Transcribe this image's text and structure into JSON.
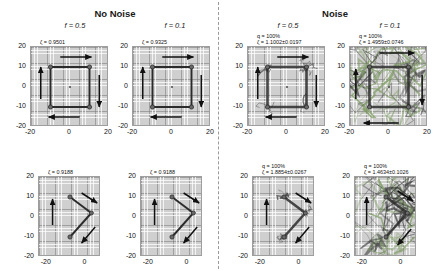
{
  "figure": {
    "groups": [
      {
        "label": "No Noise"
      },
      {
        "label": "Noise"
      }
    ],
    "columns": [
      {
        "label": "f = 0.5"
      },
      {
        "label": "f = 0.1"
      },
      {
        "label": "f = 0.5"
      },
      {
        "label": "f = 0.1"
      }
    ]
  },
  "chart_data": {
    "type": "scatter",
    "title": "",
    "xlabel": "",
    "ylabel": "",
    "grid": true,
    "legend": false,
    "panels": [
      {
        "id": "top-noise-free-f05",
        "group": "No Noise",
        "condition": "f = 0.5",
        "row": "top",
        "noise": false,
        "stat_lines": [
          "ζ = 0.9501"
        ],
        "zeta": 0.9501,
        "q": null,
        "xlim": [
          -20,
          20
        ],
        "ylim": [
          -20,
          20
        ],
        "xticks": [
          -20,
          0,
          20
        ],
        "yticks": [
          20,
          10,
          0,
          -10,
          -20
        ],
        "nodes": [
          {
            "x": -10,
            "y": 10
          },
          {
            "x": 10,
            "y": 10
          },
          {
            "x": 10,
            "y": -10
          },
          {
            "x": -10,
            "y": -10
          }
        ],
        "links": [
          [
            0,
            1
          ],
          [
            1,
            2
          ],
          [
            2,
            3
          ],
          [
            3,
            0
          ]
        ],
        "center_marker": {
          "x": 0,
          "y": 0
        },
        "arrows": [
          {
            "x1": -5,
            "y1": 15,
            "x2": 11,
            "y2": 15
          },
          {
            "x1": 5,
            "y1": -15,
            "x2": -11,
            "y2": -15
          },
          {
            "x1": -15,
            "y1": -6,
            "x2": -15,
            "y2": 10
          },
          {
            "x1": 15,
            "y1": 6,
            "x2": 15,
            "y2": -10
          }
        ]
      },
      {
        "id": "top-noise-free-f01",
        "group": "No Noise",
        "condition": "f = 0.1",
        "row": "top",
        "noise": false,
        "stat_lines": [
          "ζ = 0.9325"
        ],
        "zeta": 0.9325,
        "q": null,
        "xlim": [
          -20,
          20
        ],
        "ylim": [
          -20,
          20
        ],
        "xticks": [
          -20,
          0,
          20
        ],
        "yticks": [
          20,
          10,
          0,
          -10,
          -20
        ],
        "nodes": [
          {
            "x": -10,
            "y": 10
          },
          {
            "x": 10,
            "y": 10
          },
          {
            "x": 10,
            "y": -10
          },
          {
            "x": -10,
            "y": -10
          }
        ],
        "links": [
          [
            0,
            1
          ],
          [
            1,
            2
          ],
          [
            2,
            3
          ],
          [
            3,
            0
          ]
        ],
        "center_marker": {
          "x": 0,
          "y": 0
        },
        "arrows": [
          {
            "x1": -5,
            "y1": 15,
            "x2": 11,
            "y2": 15
          },
          {
            "x1": 5,
            "y1": -15,
            "x2": -11,
            "y2": -15
          },
          {
            "x1": -15,
            "y1": -6,
            "x2": -15,
            "y2": 10
          },
          {
            "x1": 15,
            "y1": 6,
            "x2": 15,
            "y2": -10
          }
        ]
      },
      {
        "id": "top-noise-f05",
        "group": "Noise",
        "condition": "f = 0.5",
        "row": "top",
        "noise": true,
        "noise_level": "moderate",
        "stat_lines": [
          "q = 100%",
          "ζ = 1.1002±0.0197"
        ],
        "zeta": 1.1002,
        "zeta_err": 0.0197,
        "q": "100%",
        "xlim": [
          -20,
          20
        ],
        "ylim": [
          -20,
          20
        ],
        "xticks": [
          -20,
          0,
          20
        ],
        "yticks": [
          20,
          10,
          0,
          -10,
          -20
        ],
        "nodes": [
          {
            "x": -10,
            "y": 10
          },
          {
            "x": 10,
            "y": 10
          },
          {
            "x": 10,
            "y": -10
          },
          {
            "x": -10,
            "y": -10
          }
        ],
        "links": [
          [
            0,
            1
          ],
          [
            1,
            2
          ],
          [
            2,
            3
          ],
          [
            3,
            0
          ]
        ],
        "center_marker": {
          "x": 0,
          "y": 0
        },
        "arrows": [
          {
            "x1": -5,
            "y1": 15,
            "x2": 11,
            "y2": 15
          },
          {
            "x1": 5,
            "y1": -15,
            "x2": -11,
            "y2": -15
          },
          {
            "x1": -15,
            "y1": -6,
            "x2": -15,
            "y2": 10
          },
          {
            "x1": 15,
            "y1": 6,
            "x2": 15,
            "y2": -10
          }
        ]
      },
      {
        "id": "top-noise-f01",
        "group": "Noise",
        "condition": "f = 0.1",
        "row": "top",
        "noise": true,
        "noise_level": "heavy",
        "stat_lines": [
          "q = 100%",
          "ζ = 1.4959±0.0746"
        ],
        "zeta": 1.4959,
        "zeta_err": 0.0746,
        "q": "100%",
        "xlim": [
          -20,
          20
        ],
        "ylim": [
          -20,
          20
        ],
        "xticks": [
          -20,
          0,
          20
        ],
        "yticks": [
          20,
          10,
          0,
          -10,
          -20
        ],
        "nodes": [
          {
            "x": -10,
            "y": 10
          },
          {
            "x": 10,
            "y": 10
          },
          {
            "x": 10,
            "y": -10
          },
          {
            "x": -10,
            "y": -10
          }
        ],
        "links": [
          [
            0,
            1
          ],
          [
            1,
            2
          ],
          [
            2,
            3
          ],
          [
            3,
            0
          ]
        ],
        "center_marker": {
          "x": 0,
          "y": 0
        },
        "arrows": [
          {
            "x1": -5,
            "y1": 17,
            "x2": 13,
            "y2": 17
          },
          {
            "x1": 5,
            "y1": -18,
            "x2": -13,
            "y2": -18
          },
          {
            "x1": -17,
            "y1": -6,
            "x2": -17,
            "y2": 9
          },
          {
            "x1": 17,
            "y1": 6,
            "x2": 17,
            "y2": -9
          }
        ]
      },
      {
        "id": "bottom-noise-free-f05",
        "group": "No Noise",
        "condition": "f = 0.5",
        "row": "bottom",
        "noise": false,
        "stat_lines": [
          "ζ = 0.9188"
        ],
        "zeta": 0.9188,
        "q": null,
        "xlim": [
          -24,
          8
        ],
        "ylim": [
          -20,
          20
        ],
        "xticks": [
          -20,
          0
        ],
        "yticks": [
          20,
          10,
          0,
          -10,
          -20
        ],
        "nodes": [
          {
            "x": -8,
            "y": 10
          },
          {
            "x": 3,
            "y": 2
          },
          {
            "x": -8,
            "y": -10
          }
        ],
        "links": [
          [
            0,
            1
          ],
          [
            1,
            2
          ]
        ],
        "center_marker": null,
        "arrows": [
          {
            "x1": -2,
            "y1": 12,
            "x2": 6,
            "y2": 7
          },
          {
            "x1": -17,
            "y1": -4,
            "x2": -17,
            "y2": 9
          },
          {
            "x1": 5,
            "y1": -5,
            "x2": -2,
            "y2": -13
          }
        ]
      },
      {
        "id": "bottom-noise-free-f01",
        "group": "No Noise",
        "condition": "f = 0.1",
        "row": "bottom",
        "noise": false,
        "stat_lines": [
          "ζ = 0.9188"
        ],
        "zeta": 0.9188,
        "q": null,
        "xlim": [
          -24,
          8
        ],
        "ylim": [
          -20,
          20
        ],
        "xticks": [
          -20,
          0
        ],
        "yticks": [
          20,
          10,
          0,
          -10,
          -20
        ],
        "nodes": [
          {
            "x": -8,
            "y": 10
          },
          {
            "x": 3,
            "y": 2
          },
          {
            "x": -8,
            "y": -10
          }
        ],
        "links": [
          [
            0,
            1
          ],
          [
            1,
            2
          ]
        ],
        "center_marker": null,
        "arrows": [
          {
            "x1": -2,
            "y1": 12,
            "x2": 6,
            "y2": 7
          },
          {
            "x1": -17,
            "y1": -4,
            "x2": -17,
            "y2": 9
          },
          {
            "x1": 5,
            "y1": -5,
            "x2": -2,
            "y2": -13
          }
        ]
      },
      {
        "id": "bottom-noise-f05",
        "group": "Noise",
        "condition": "f = 0.5",
        "row": "bottom",
        "noise": true,
        "noise_level": "moderate",
        "stat_lines": [
          "q = 100%",
          "ζ = 1.8854±0.0267"
        ],
        "zeta": 1.8854,
        "zeta_err": 0.0267,
        "q": "100%",
        "xlim": [
          -24,
          8
        ],
        "ylim": [
          -20,
          20
        ],
        "xticks": [
          -20,
          0
        ],
        "yticks": [
          20,
          10,
          0,
          -10,
          -20
        ],
        "nodes": [
          {
            "x": -8,
            "y": 10
          },
          {
            "x": 3,
            "y": 2
          },
          {
            "x": -8,
            "y": -10
          }
        ],
        "links": [
          [
            0,
            1
          ],
          [
            1,
            2
          ]
        ],
        "center_marker": null,
        "arrows": [
          {
            "x1": -2,
            "y1": 12,
            "x2": 6,
            "y2": 7
          },
          {
            "x1": -17,
            "y1": -4,
            "x2": -17,
            "y2": 9
          },
          {
            "x1": 5,
            "y1": -5,
            "x2": -2,
            "y2": -13
          }
        ]
      },
      {
        "id": "bottom-noise-f01",
        "group": "Noise",
        "condition": "f = 0.1",
        "row": "bottom",
        "noise": true,
        "noise_level": "heavy",
        "stat_lines": [
          "q = 100%",
          "ζ = 1.4634±0.1026"
        ],
        "zeta": 1.4634,
        "zeta_err": 0.1026,
        "q": "100%",
        "xlim": [
          -24,
          8
        ],
        "ylim": [
          -20,
          20
        ],
        "xticks": [
          -20,
          0
        ],
        "yticks": [
          20,
          10,
          0,
          -10,
          -20
        ],
        "nodes": [
          {
            "x": -8,
            "y": 10
          },
          {
            "x": 3,
            "y": 2
          },
          {
            "x": -8,
            "y": -10
          }
        ],
        "links": [
          [
            0,
            1
          ],
          [
            1,
            2
          ]
        ],
        "center_marker": null,
        "arrows": [
          {
            "x1": -2,
            "y1": 13,
            "x2": 6,
            "y2": 8
          },
          {
            "x1": -18,
            "y1": -4,
            "x2": -18,
            "y2": 10
          },
          {
            "x1": 5,
            "y1": -6,
            "x2": -2,
            "y2": -14
          }
        ]
      }
    ],
    "colors": {
      "node": "#6a6a6a",
      "link": "#2b2b2b",
      "arrow": "#111111",
      "noise_dark": "#3a3a3a",
      "noise_green": "#7d9b62",
      "panel_bg": "#cfcfcf",
      "divider": "#9a9a9a"
    }
  }
}
